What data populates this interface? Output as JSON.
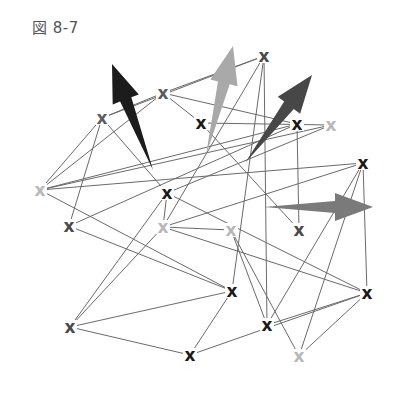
{
  "figure": {
    "label": "図 8-7"
  },
  "colors": {
    "edge": "#6a6a6a",
    "black": "#1a1a1a",
    "dark_gray": "#4a4a4a",
    "gray": "#5c5c5c",
    "light_gray": "#b8b8b8"
  },
  "nodes": [
    {
      "id": "n1",
      "x": 264,
      "y": 56,
      "glyph": "x",
      "tone": "dark_gray"
    },
    {
      "id": "n2",
      "x": 163,
      "y": 93,
      "glyph": "x",
      "tone": "gray"
    },
    {
      "id": "n3",
      "x": 102,
      "y": 118,
      "glyph": "x",
      "tone": "gray"
    },
    {
      "id": "n4",
      "x": 201,
      "y": 123,
      "glyph": "x",
      "tone": "black"
    },
    {
      "id": "n5",
      "x": 297,
      "y": 124,
      "glyph": "x",
      "tone": "black"
    },
    {
      "id": "n6",
      "x": 331,
      "y": 125,
      "glyph": "x",
      "tone": "light_gray"
    },
    {
      "id": "n7",
      "x": 363,
      "y": 163,
      "glyph": "x",
      "tone": "black"
    },
    {
      "id": "n8",
      "x": 40,
      "y": 190,
      "glyph": "x",
      "tone": "light_gray"
    },
    {
      "id": "n9",
      "x": 167,
      "y": 193,
      "glyph": "x",
      "tone": "black"
    },
    {
      "id": "n10",
      "x": 69,
      "y": 226,
      "glyph": "x",
      "tone": "dark_gray"
    },
    {
      "id": "n11",
      "x": 163,
      "y": 227,
      "glyph": "x",
      "tone": "light_gray"
    },
    {
      "id": "n12",
      "x": 231,
      "y": 230,
      "glyph": "x",
      "tone": "light_gray"
    },
    {
      "id": "n13",
      "x": 299,
      "y": 230,
      "glyph": "x",
      "tone": "dark_gray"
    },
    {
      "id": "n14",
      "x": 232,
      "y": 291,
      "glyph": "x",
      "tone": "black"
    },
    {
      "id": "n15",
      "x": 367,
      "y": 293,
      "glyph": "x",
      "tone": "black"
    },
    {
      "id": "n16",
      "x": 70,
      "y": 327,
      "glyph": "x",
      "tone": "dark_gray"
    },
    {
      "id": "n17",
      "x": 267,
      "y": 325,
      "glyph": "x",
      "tone": "black"
    },
    {
      "id": "n18",
      "x": 190,
      "y": 355,
      "glyph": "x",
      "tone": "black"
    },
    {
      "id": "n19",
      "x": 299,
      "y": 356,
      "glyph": "x",
      "tone": "light_gray"
    }
  ],
  "edges": [
    [
      "n2",
      "n3"
    ],
    [
      "n2",
      "n5"
    ],
    [
      "n2",
      "n4"
    ],
    [
      "n1",
      "n2"
    ],
    [
      "n1",
      "n3"
    ],
    [
      "n1",
      "n11"
    ],
    [
      "n1",
      "n17"
    ],
    [
      "n1",
      "n14"
    ],
    [
      "n3",
      "n8"
    ],
    [
      "n3",
      "n10"
    ],
    [
      "n3",
      "n9"
    ],
    [
      "n4",
      "n6"
    ],
    [
      "n8",
      "n6"
    ],
    [
      "n8",
      "n7"
    ],
    [
      "n8",
      "n2"
    ],
    [
      "n8",
      "n14"
    ],
    [
      "n5",
      "n13"
    ],
    [
      "n5",
      "n8"
    ],
    [
      "n6",
      "n9"
    ],
    [
      "n7",
      "n11"
    ],
    [
      "n7",
      "n17"
    ],
    [
      "n7",
      "n19"
    ],
    [
      "n7",
      "n15"
    ],
    [
      "n9",
      "n15"
    ],
    [
      "n9",
      "n16"
    ],
    [
      "n9",
      "n11"
    ],
    [
      "n10",
      "n5"
    ],
    [
      "n10",
      "n14"
    ],
    [
      "n11",
      "n16"
    ],
    [
      "n11",
      "n15"
    ],
    [
      "n11",
      "n12"
    ],
    [
      "n12",
      "n17"
    ],
    [
      "n12",
      "n19"
    ],
    [
      "n13",
      "n4"
    ],
    [
      "n14",
      "n16"
    ],
    [
      "n14",
      "n18"
    ],
    [
      "n16",
      "n18"
    ],
    [
      "n17",
      "n15"
    ],
    [
      "n19",
      "n15"
    ],
    [
      "n18",
      "n15"
    ]
  ],
  "arrows": [
    {
      "id": "arrow-black",
      "color": "#1c1c1c",
      "tail": [
        153,
        170
      ],
      "head": [
        112,
        64
      ]
    },
    {
      "id": "arrow-light",
      "color": "#a9a9a9",
      "tail": [
        206,
        155
      ],
      "head": [
        233,
        46
      ]
    },
    {
      "id": "arrow-dark",
      "color": "#474747",
      "tail": [
        245,
        163
      ],
      "head": [
        312,
        75
      ]
    },
    {
      "id": "arrow-gray",
      "color": "#7a7a7a",
      "tail": [
        264,
        207
      ],
      "head": [
        373,
        207
      ]
    }
  ]
}
